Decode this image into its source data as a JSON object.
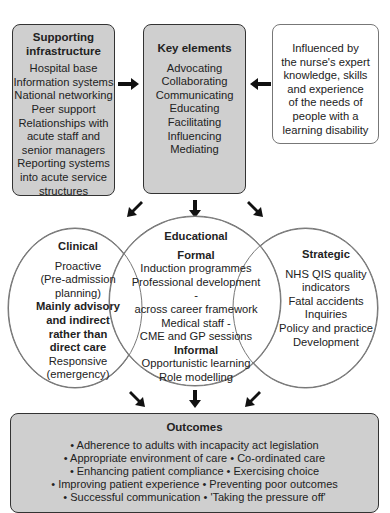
{
  "supporting": {
    "title_1": "Supporting",
    "title_2": "infrastructure",
    "items": [
      "Hospital base",
      "Information systems",
      "National networking",
      "Peer support",
      "Relationships with",
      "acute staff and",
      "senior managers",
      "Reporting systems",
      "into acute service",
      "structures"
    ]
  },
  "key_elements": {
    "title": "Key elements",
    "items": [
      "Advocating",
      "Collaborating",
      "Communicating",
      "Educating",
      "Facilitating",
      "Influencing",
      "Mediating"
    ]
  },
  "influenced": {
    "lines": [
      "Influenced by",
      "the nurse's expert",
      "knowledge, skills",
      "and experience",
      "of the needs of",
      "people with a",
      "learning disability"
    ]
  },
  "clinical": {
    "title": "Clinical",
    "lines": [
      "Proactive",
      "(Pre-admission",
      "planning)"
    ],
    "bold_lines": [
      "Mainly advisory",
      "and indirect",
      "rather than",
      "direct care"
    ],
    "lines_after": [
      "Responsive",
      "(emergency)"
    ]
  },
  "educational": {
    "title": "Educational",
    "formal_title": "Formal",
    "formal": [
      "Induction programmes",
      "Professional development -",
      "across career framework",
      "Medical staff -",
      "CME and GP sessions"
    ],
    "informal_title": "Informal",
    "informal": [
      "Opportunistic learning",
      "Role modelling"
    ]
  },
  "strategic": {
    "title": "Strategic",
    "lines": [
      "NHS QIS quality",
      "indicators",
      "Fatal accidents",
      "Inquiries",
      "Policy and practice",
      "Development"
    ]
  },
  "outcomes": {
    "title": "Outcomes",
    "lines": [
      "• Adherence to adults with incapacity act legislation",
      "• Appropriate environment of care  • Co-ordinated care",
      "• Enhancing patient compliance  • Exercising choice",
      "• Improving patient experience  • Preventing poor outcomes",
      "• Successful communication  • 'Taking the pressure off'"
    ]
  }
}
